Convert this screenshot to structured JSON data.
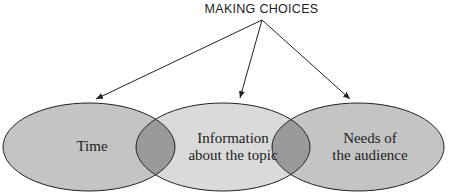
{
  "diagram": {
    "title": "MAKING CHOICES",
    "circles": [
      {
        "label_line1": "Time",
        "label_line2": ""
      },
      {
        "label_line1": "Information",
        "label_line2": "about the topic"
      },
      {
        "label_line1": "Needs of",
        "label_line2": "the audience"
      }
    ],
    "colors": {
      "outer_fill": "#c4c4c4",
      "middle_fill": "#dadada",
      "overlap_fill": "#9a9a9a",
      "stroke": "#222222"
    }
  }
}
